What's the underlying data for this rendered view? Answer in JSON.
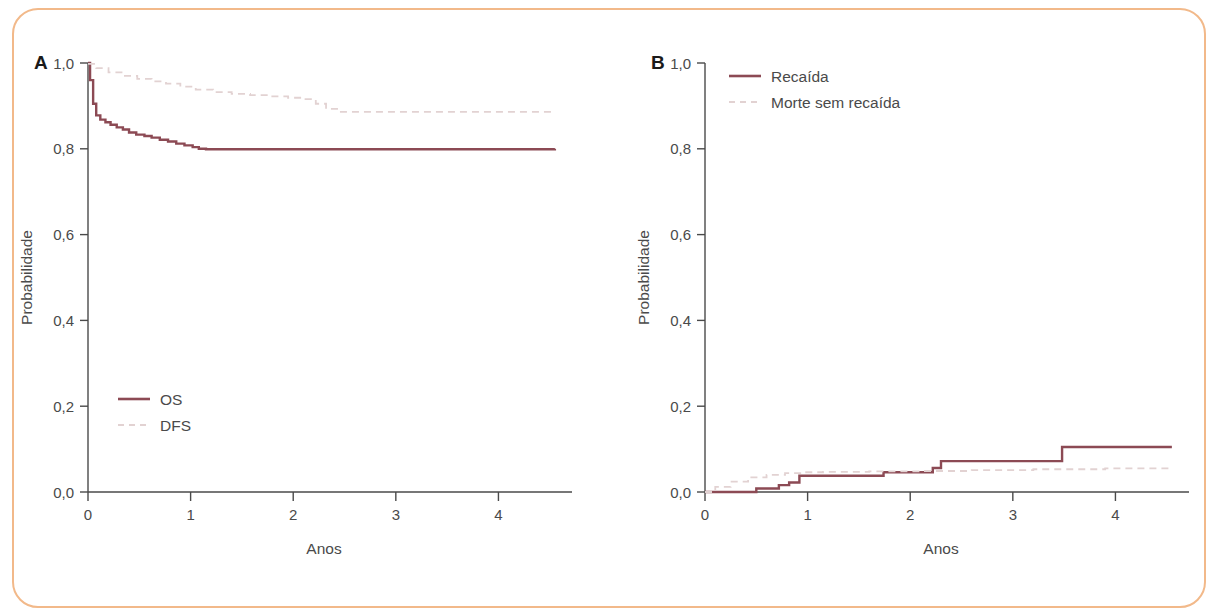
{
  "figure": {
    "border_color": "#f2b98a",
    "background": "#ffffff"
  },
  "style": {
    "solid_color": "#8c4a54",
    "dashed_color": "#e2d2d2",
    "axis_color": "#4a4a4a",
    "text_color": "#4a4a4a"
  },
  "panel_a": {
    "letter": "A",
    "ylabel": "Probabilidade",
    "xlabel": "Anos",
    "yticks": [
      "0,0",
      "0,2",
      "0,4",
      "0,6",
      "0,8",
      "1,0"
    ],
    "xticks": [
      "0",
      "1",
      "2",
      "3",
      "4"
    ],
    "legend": [
      {
        "label": "OS",
        "style": "solid"
      },
      {
        "label": "DFS",
        "style": "dashed"
      }
    ]
  },
  "panel_b": {
    "letter": "B",
    "ylabel": "Probabilidade",
    "xlabel": "Anos",
    "yticks": [
      "0,0",
      "0,2",
      "0,4",
      "0,6",
      "0,8",
      "1,0"
    ],
    "xticks": [
      "0",
      "1",
      "2",
      "3",
      "4"
    ],
    "legend": [
      {
        "label": "Recaída",
        "style": "solid"
      },
      {
        "label": "Morte sem recaída",
        "style": "dashed"
      }
    ]
  },
  "chart_data": [
    {
      "type": "line",
      "panel": "A",
      "title": "",
      "xlabel": "Anos",
      "ylabel": "Probabilidade",
      "xlim": [
        0,
        4.6
      ],
      "ylim": [
        0.0,
        1.0
      ],
      "xticks": [
        0,
        1,
        2,
        3,
        4
      ],
      "ytick_values": [
        0.0,
        0.2,
        0.4,
        0.6,
        0.8,
        1.0
      ],
      "ytick_labels": [
        "0,0",
        "0,2",
        "0,4",
        "0,6",
        "0,8",
        "1,0"
      ],
      "xtick_labels": [
        "0",
        "1",
        "2",
        "3",
        "4"
      ],
      "grid": false,
      "legend_position": "bottom-left",
      "curve_style": "kaplan-meier-step",
      "series": [
        {
          "name": "OS",
          "style": "solid",
          "color": "#8c4a54",
          "x": [
            0.0,
            0.02,
            0.05,
            0.08,
            0.12,
            0.17,
            0.22,
            0.28,
            0.34,
            0.4,
            0.47,
            0.55,
            0.62,
            0.7,
            0.78,
            0.86,
            0.94,
            1.02,
            1.08,
            1.15,
            4.55
          ],
          "y": [
            1.0,
            0.96,
            0.905,
            0.878,
            0.868,
            0.862,
            0.856,
            0.85,
            0.845,
            0.838,
            0.833,
            0.83,
            0.826,
            0.821,
            0.817,
            0.812,
            0.808,
            0.804,
            0.8,
            0.799,
            0.8
          ]
        },
        {
          "name": "DFS",
          "style": "dashed",
          "color": "#e2d2d2",
          "x": [
            0.0,
            0.08,
            0.2,
            0.34,
            0.48,
            0.62,
            0.76,
            0.9,
            1.05,
            1.22,
            1.4,
            1.58,
            1.76,
            1.95,
            2.12,
            2.22,
            2.32,
            2.45,
            4.55
          ],
          "y": [
            0.998,
            0.988,
            0.978,
            0.97,
            0.963,
            0.957,
            0.952,
            0.945,
            0.938,
            0.932,
            0.928,
            0.925,
            0.922,
            0.919,
            0.916,
            0.905,
            0.893,
            0.886,
            0.886
          ]
        }
      ]
    },
    {
      "type": "line",
      "panel": "B",
      "title": "",
      "xlabel": "Anos",
      "ylabel": "Probabilidade",
      "xlim": [
        0,
        4.6
      ],
      "ylim": [
        0.0,
        1.0
      ],
      "xticks": [
        0,
        1,
        2,
        3,
        4
      ],
      "ytick_values": [
        0.0,
        0.2,
        0.4,
        0.6,
        0.8,
        1.0
      ],
      "ytick_labels": [
        "0,0",
        "0,2",
        "0,4",
        "0,6",
        "0,8",
        "1,0"
      ],
      "xtick_labels": [
        "0",
        "1",
        "2",
        "3",
        "4"
      ],
      "grid": false,
      "legend_position": "top-left",
      "curve_style": "cumulative-incidence-step",
      "series": [
        {
          "name": "Recaída",
          "style": "solid",
          "color": "#8c4a54",
          "x": [
            0.0,
            0.48,
            0.5,
            0.7,
            0.72,
            0.8,
            0.82,
            0.9,
            0.92,
            1.72,
            1.74,
            2.2,
            2.22,
            2.28,
            2.3,
            3.46,
            3.48,
            4.55
          ],
          "y": [
            0.0,
            0.0,
            0.008,
            0.008,
            0.016,
            0.016,
            0.022,
            0.022,
            0.038,
            0.038,
            0.046,
            0.046,
            0.056,
            0.056,
            0.072,
            0.072,
            0.105,
            0.105
          ]
        },
        {
          "name": "Morte sem recaída",
          "style": "dashed",
          "color": "#e2d2d2",
          "x": [
            0.0,
            0.1,
            0.25,
            0.42,
            0.6,
            0.78,
            0.95,
            1.15,
            1.6,
            2.1,
            2.6,
            3.2,
            3.9,
            4.55
          ],
          "y": [
            0.0,
            0.012,
            0.024,
            0.034,
            0.04,
            0.044,
            0.046,
            0.047,
            0.048,
            0.049,
            0.051,
            0.053,
            0.055,
            0.056
          ]
        }
      ]
    }
  ]
}
